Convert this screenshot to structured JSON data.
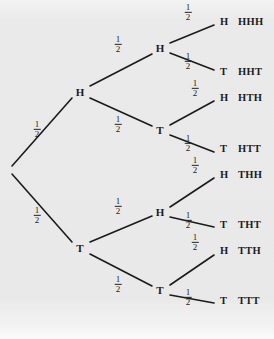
{
  "figure": {
    "name": "coin-flip-probability-tree",
    "background_color": "#ebebeb",
    "ink_color": "#1b1b1b",
    "levels": 3,
    "outcome_count": 8
  },
  "labels": {
    "heads": "H",
    "tails": "T",
    "probability_numerator": "1",
    "probability_denominator": "2"
  },
  "nodes": [
    {
      "id": "root",
      "label": "",
      "x": 9,
      "y": 170
    },
    {
      "id": "h",
      "label": "H",
      "x": 80,
      "y": 92
    },
    {
      "id": "t",
      "label": "T",
      "x": 80,
      "y": 248
    },
    {
      "id": "hh",
      "label": "H",
      "x": 160,
      "y": 48
    },
    {
      "id": "ht",
      "label": "T",
      "x": 160,
      "y": 130
    },
    {
      "id": "th",
      "label": "H",
      "x": 160,
      "y": 212
    },
    {
      "id": "tt",
      "label": "T",
      "x": 160,
      "y": 290
    }
  ],
  "edges": [
    {
      "id": "root-h",
      "from": "root",
      "to": "h",
      "x1": 12,
      "y1": 166,
      "x2": 72,
      "y2": 98,
      "prob_x": 37,
      "prob_y": 130
    },
    {
      "id": "root-t",
      "from": "root",
      "to": "t",
      "x1": 12,
      "y1": 174,
      "x2": 72,
      "y2": 242,
      "prob_x": 37,
      "prob_y": 216
    },
    {
      "id": "h-hh",
      "from": "h",
      "to": "hh",
      "x1": 90,
      "y1": 86,
      "x2": 152,
      "y2": 54,
      "prob_x": 118,
      "prob_y": 45
    },
    {
      "id": "h-ht",
      "from": "h",
      "to": "ht",
      "x1": 90,
      "y1": 98,
      "x2": 152,
      "y2": 126,
      "prob_x": 118,
      "prob_y": 125
    },
    {
      "id": "t-th",
      "from": "t",
      "to": "th",
      "x1": 90,
      "y1": 242,
      "x2": 152,
      "y2": 216,
      "prob_x": 118,
      "prob_y": 207
    },
    {
      "id": "t-tt",
      "from": "t",
      "to": "tt",
      "x1": 90,
      "y1": 254,
      "x2": 152,
      "y2": 286,
      "prob_x": 118,
      "prob_y": 285
    },
    {
      "id": "hh-hhh",
      "from": "hh",
      "to": "hhh",
      "x1": 170,
      "y1": 43,
      "x2": 214,
      "y2": 25,
      "prob_x": 188,
      "prob_y": 13
    },
    {
      "id": "hh-hht",
      "from": "hh",
      "to": "hht",
      "x1": 170,
      "y1": 53,
      "x2": 214,
      "y2": 70,
      "prob_x": 188,
      "prob_y": 62
    },
    {
      "id": "ht-hth",
      "from": "ht",
      "to": "hth",
      "x1": 170,
      "y1": 125,
      "x2": 214,
      "y2": 101,
      "prob_x": 195,
      "prob_y": 89
    },
    {
      "id": "ht-htt",
      "from": "ht",
      "to": "htt",
      "x1": 170,
      "y1": 135,
      "x2": 214,
      "y2": 152,
      "prob_x": 188,
      "prob_y": 144
    },
    {
      "id": "th-thh",
      "from": "th",
      "to": "thh",
      "x1": 170,
      "y1": 207,
      "x2": 214,
      "y2": 178,
      "prob_x": 195,
      "prob_y": 166
    },
    {
      "id": "th-tht",
      "from": "th",
      "to": "tht",
      "x1": 170,
      "y1": 217,
      "x2": 214,
      "y2": 227,
      "prob_x": 188,
      "prob_y": 221
    },
    {
      "id": "tt-tth",
      "from": "tt",
      "to": "tth",
      "x1": 170,
      "y1": 285,
      "x2": 214,
      "y2": 255,
      "prob_x": 195,
      "prob_y": 243
    },
    {
      "id": "tt-ttt",
      "from": "tt",
      "to": "ttt",
      "x1": 170,
      "y1": 295,
      "x2": 214,
      "y2": 303,
      "prob_x": 188,
      "prob_y": 298
    }
  ],
  "outcomes": [
    {
      "id": "hhh",
      "flip": "H",
      "sequence": "HHH",
      "y": 22
    },
    {
      "id": "hht",
      "flip": "T",
      "sequence": "HHT",
      "y": 72
    },
    {
      "id": "hth",
      "flip": "H",
      "sequence": "HTH",
      "y": 98
    },
    {
      "id": "htt",
      "flip": "T",
      "sequence": "HTT",
      "y": 149
    },
    {
      "id": "thh",
      "flip": "H",
      "sequence": "THH",
      "y": 175
    },
    {
      "id": "tht",
      "flip": "T",
      "sequence": "THT",
      "y": 225
    },
    {
      "id": "tth",
      "flip": "H",
      "sequence": "TTH",
      "y": 251
    },
    {
      "id": "ttt",
      "flip": "T",
      "sequence": "TTT",
      "y": 301
    }
  ],
  "geometry": {
    "flip_x": 220,
    "sequence_x": 238
  }
}
